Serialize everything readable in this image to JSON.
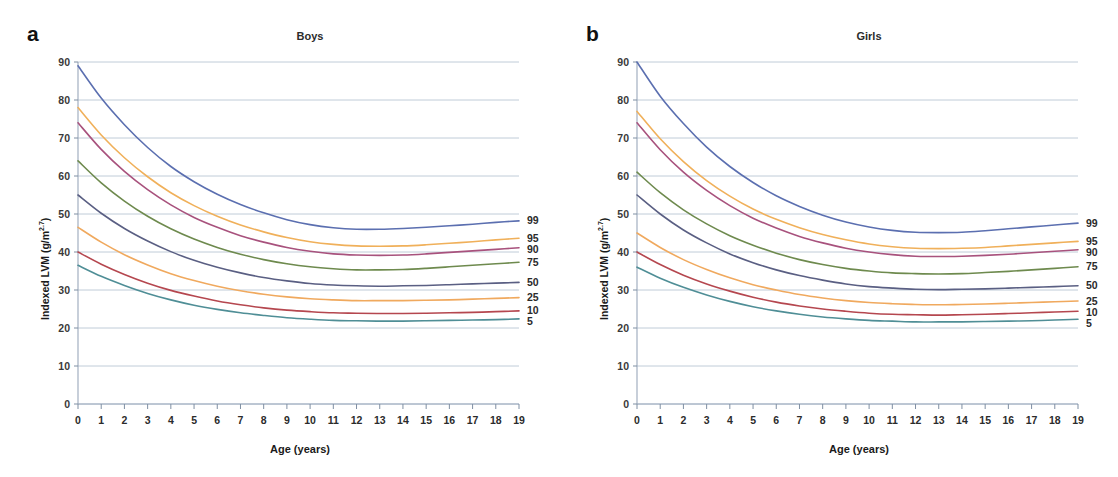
{
  "figure": {
    "panels": [
      {
        "letter": "a",
        "title": "Boys",
        "xlabel": "Age (years)",
        "ylabel_main": "Indexed LVM (g/m",
        "ylabel_sup": "2.7",
        "ylabel_tail": ")"
      },
      {
        "letter": "b",
        "title": "Girls",
        "xlabel": "Age (years)",
        "ylabel_main": "Indexed LVM (g/m",
        "ylabel_sup": "2.7",
        "ylabel_tail": ")"
      }
    ]
  },
  "chart_data": [
    {
      "type": "line",
      "title": "Boys",
      "panel_letter": "a",
      "xlabel": "Age (years)",
      "ylabel": "Indexed LVM (g/m2.7)",
      "xlim": [
        0,
        19
      ],
      "ylim": [
        0,
        90
      ],
      "xticks": [
        0,
        1,
        2,
        3,
        4,
        5,
        6,
        7,
        8,
        9,
        10,
        11,
        12,
        13,
        14,
        15,
        16,
        17,
        18,
        19
      ],
      "yticks": [
        0,
        10,
        20,
        30,
        40,
        50,
        60,
        70,
        80,
        90
      ],
      "grid": true,
      "legend_position": "right-of-axis-end-labels",
      "series": [
        {
          "name": "99",
          "label": "99",
          "color": "#5b6fb0",
          "values": [
            89.0,
            80.5,
            73.5,
            67.5,
            62.5,
            58.5,
            55.2,
            52.5,
            50.3,
            48.5,
            47.2,
            46.4,
            46.0,
            46.0,
            46.2,
            46.5,
            46.9,
            47.3,
            47.8,
            48.2
          ]
        },
        {
          "name": "95",
          "label": "95",
          "color": "#f0b05a",
          "values": [
            78.0,
            70.8,
            64.8,
            59.8,
            55.6,
            52.2,
            49.4,
            47.1,
            45.3,
            43.8,
            42.7,
            42.0,
            41.6,
            41.5,
            41.6,
            41.9,
            42.3,
            42.7,
            43.2,
            43.6
          ]
        },
        {
          "name": "90",
          "label": "90",
          "color": "#a8527d",
          "values": [
            74.0,
            67.0,
            61.2,
            56.4,
            52.4,
            49.1,
            46.5,
            44.3,
            42.6,
            41.2,
            40.2,
            39.5,
            39.2,
            39.1,
            39.2,
            39.5,
            39.9,
            40.3,
            40.7,
            41.1
          ]
        },
        {
          "name": "75",
          "label": "75",
          "color": "#6e8a4e",
          "values": [
            64.0,
            58.2,
            53.4,
            49.4,
            46.1,
            43.4,
            41.2,
            39.4,
            38.0,
            36.9,
            36.1,
            35.6,
            35.3,
            35.3,
            35.4,
            35.7,
            36.1,
            36.5,
            36.9,
            37.3
          ]
        },
        {
          "name": "50",
          "label": "50",
          "color": "#5a5f83",
          "values": [
            55.0,
            50.2,
            46.2,
            42.9,
            40.1,
            37.8,
            36.0,
            34.5,
            33.3,
            32.4,
            31.7,
            31.3,
            31.1,
            31.0,
            31.1,
            31.2,
            31.4,
            31.6,
            31.8,
            32.0
          ]
        },
        {
          "name": "25",
          "label": "25",
          "color": "#f0a95e",
          "values": [
            46.5,
            42.6,
            39.3,
            36.6,
            34.3,
            32.5,
            31.0,
            29.8,
            28.9,
            28.2,
            27.7,
            27.4,
            27.2,
            27.2,
            27.2,
            27.3,
            27.4,
            27.6,
            27.8,
            28.0
          ]
        },
        {
          "name": "10",
          "label": "10",
          "color": "#b5474f",
          "values": [
            40.0,
            36.8,
            34.1,
            31.8,
            29.9,
            28.4,
            27.1,
            26.1,
            25.3,
            24.7,
            24.3,
            24.0,
            23.9,
            23.8,
            23.8,
            23.9,
            24.0,
            24.1,
            24.3,
            24.5
          ]
        },
        {
          "name": "5",
          "label": "5",
          "color": "#4f8e96",
          "values": [
            36.5,
            33.6,
            31.2,
            29.1,
            27.4,
            26.0,
            24.9,
            24.0,
            23.3,
            22.7,
            22.3,
            22.0,
            21.9,
            21.8,
            21.8,
            21.9,
            22.0,
            22.1,
            22.2,
            22.4
          ]
        }
      ]
    },
    {
      "type": "line",
      "title": "Girls",
      "panel_letter": "b",
      "xlabel": "Age (years)",
      "ylabel": "Indexed LVM (g/m2.7)",
      "xlim": [
        0,
        19
      ],
      "ylim": [
        0,
        90
      ],
      "xticks": [
        0,
        1,
        2,
        3,
        4,
        5,
        6,
        7,
        8,
        9,
        10,
        11,
        12,
        13,
        14,
        15,
        16,
        17,
        18,
        19
      ],
      "yticks": [
        0,
        10,
        20,
        30,
        40,
        50,
        60,
        70,
        80,
        90
      ],
      "grid": true,
      "legend_position": "right-of-axis-end-labels",
      "series": [
        {
          "name": "99",
          "label": "99",
          "color": "#5b6fb0",
          "values": [
            90.0,
            81.0,
            73.8,
            67.6,
            62.5,
            58.3,
            54.8,
            52.0,
            49.7,
            47.9,
            46.6,
            45.7,
            45.2,
            45.1,
            45.2,
            45.6,
            46.1,
            46.6,
            47.1,
            47.6
          ]
        },
        {
          "name": "95",
          "label": "95",
          "color": "#f0b05a",
          "values": [
            77.0,
            69.8,
            63.8,
            58.8,
            54.7,
            51.3,
            48.6,
            46.4,
            44.6,
            43.2,
            42.1,
            41.4,
            41.0,
            40.9,
            41.0,
            41.2,
            41.6,
            42.0,
            42.4,
            42.8
          ]
        },
        {
          "name": "90",
          "label": "90",
          "color": "#a8527d",
          "values": [
            74.0,
            66.9,
            61.0,
            56.2,
            52.2,
            48.9,
            46.3,
            44.1,
            42.4,
            41.0,
            40.0,
            39.3,
            38.9,
            38.8,
            38.9,
            39.1,
            39.4,
            39.8,
            40.2,
            40.6
          ]
        },
        {
          "name": "75",
          "label": "75",
          "color": "#6e8a4e",
          "values": [
            61.0,
            55.6,
            51.1,
            47.4,
            44.3,
            41.8,
            39.7,
            38.0,
            36.7,
            35.7,
            35.0,
            34.5,
            34.3,
            34.2,
            34.3,
            34.6,
            34.9,
            35.3,
            35.7,
            36.1
          ]
        },
        {
          "name": "50",
          "label": "50",
          "color": "#5a5f83",
          "values": [
            55.0,
            50.0,
            45.8,
            42.4,
            39.5,
            37.2,
            35.3,
            33.8,
            32.6,
            31.6,
            30.9,
            30.5,
            30.2,
            30.1,
            30.2,
            30.3,
            30.5,
            30.7,
            30.9,
            31.1
          ]
        },
        {
          "name": "25",
          "label": "25",
          "color": "#f0a95e",
          "values": [
            45.0,
            41.2,
            38.0,
            35.4,
            33.2,
            31.4,
            30.0,
            28.8,
            27.9,
            27.2,
            26.7,
            26.4,
            26.2,
            26.1,
            26.2,
            26.3,
            26.5,
            26.7,
            26.9,
            27.1
          ]
        },
        {
          "name": "10",
          "label": "10",
          "color": "#b5474f",
          "values": [
            40.0,
            36.7,
            33.9,
            31.6,
            29.7,
            28.1,
            26.8,
            25.8,
            25.0,
            24.4,
            23.9,
            23.6,
            23.5,
            23.4,
            23.5,
            23.6,
            23.8,
            24.0,
            24.2,
            24.4
          ]
        },
        {
          "name": "5",
          "label": "5",
          "color": "#4f8e96",
          "values": [
            36.0,
            33.1,
            30.7,
            28.7,
            27.0,
            25.6,
            24.5,
            23.6,
            22.9,
            22.4,
            22.0,
            21.8,
            21.6,
            21.6,
            21.6,
            21.7,
            21.8,
            21.9,
            22.1,
            22.3
          ]
        }
      ]
    }
  ]
}
